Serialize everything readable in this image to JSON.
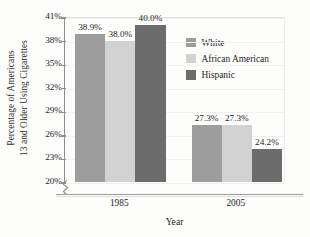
{
  "chart_data": {
    "type": "bar",
    "title": "",
    "subtitle": "",
    "xlabel": "Year",
    "ylabel": "Percentage of Americans 13 and Older Using Cigarettes",
    "ylabel_lines": [
      "Percentage of Americans",
      "13 and Older Using Cigarettes"
    ],
    "categories": [
      "1985",
      "2005"
    ],
    "series": [
      {
        "name": "White",
        "values": [
          38.9,
          38.0
        ],
        "color": "#9d9d9d",
        "labels": [
          "38.9%",
          "38.0%"
        ]
      },
      {
        "name": "African American",
        "values": [
          38.0,
          27.3
        ],
        "color": "#d2d2d2",
        "labels": [
          "38.0%",
          "27.3%"
        ]
      },
      {
        "name": "Hispanic",
        "values": [
          40.0,
          24.2
        ],
        "color": "#6c6c6c",
        "labels": [
          "40.0%",
          "24.2%"
        ]
      }
    ],
    "group_values": [
      {
        "category": "1985",
        "bars": [
          {
            "series": "White",
            "value": 38.9,
            "label": "38.9%",
            "color": "#9d9d9d"
          },
          {
            "series": "African American",
            "value": 38.0,
            "label": "38.0%",
            "color": "#d2d2d2"
          },
          {
            "series": "Hispanic",
            "value": 40.0,
            "label": "40.0%",
            "color": "#6c6c6c"
          }
        ]
      },
      {
        "category": "2005",
        "bars": [
          {
            "series": "White",
            "value": 27.3,
            "label": "27.3%",
            "color": "#9d9d9d"
          },
          {
            "series": "African American",
            "value": 27.3,
            "label": "27.3%",
            "color": "#d2d2d2"
          },
          {
            "series": "Hispanic",
            "value": 24.2,
            "label": "24.2%",
            "color": "#6c6c6c"
          }
        ]
      }
    ],
    "ylim": [
      20,
      41
    ],
    "yticks": [
      20,
      23,
      26,
      29,
      32,
      35,
      38,
      41
    ],
    "ytick_labels": [
      "20%",
      "23%",
      "26%",
      "29%",
      "32%",
      "35%",
      "38%",
      "41%"
    ],
    "y_axis_break": true,
    "grid": "faint-horizontal",
    "legend_position": "top-right-inside",
    "legend_entries": [
      {
        "label": "White",
        "color": "#9d9d9d"
      },
      {
        "label": "African American",
        "color": "#d2d2d2"
      },
      {
        "label": "Hispanic",
        "color": "#6c6c6c"
      }
    ],
    "value_labels_shown": true,
    "value_label_suffix": "%"
  },
  "axis": {
    "x_title": "Year",
    "y_title_line1": "Percentage of Americans",
    "y_title_line2": "13 and Older Using Cigarettes"
  },
  "colors": {
    "white_series": "#9d9d9d",
    "african_american_series": "#d2d2d2",
    "hispanic_series": "#6c6c6c",
    "axis": "#8e8e8e",
    "text": "#242424",
    "background": "#fdfdfc"
  }
}
